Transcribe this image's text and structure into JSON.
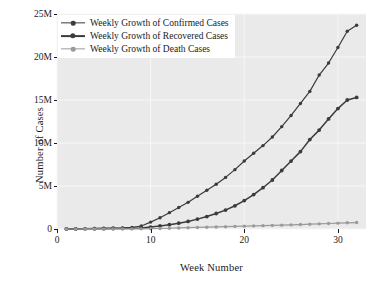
{
  "chart_data": {
    "type": "line",
    "title": "",
    "xlabel": "Week Number",
    "ylabel": "Number of Cases",
    "xlim": [
      0,
      33
    ],
    "ylim": [
      0,
      25000000
    ],
    "xticks": [
      0,
      10,
      20,
      30
    ],
    "xticklabels": [
      "0",
      "10",
      "20",
      "30"
    ],
    "yticks": [
      0,
      5000000,
      10000000,
      15000000,
      20000000,
      25000000
    ],
    "yticklabels": [
      "0",
      "5M",
      "10M",
      "15M",
      "20M",
      "25M"
    ],
    "grid": true,
    "legend_position": "upper left",
    "x": [
      1,
      2,
      3,
      4,
      5,
      6,
      7,
      8,
      9,
      10,
      11,
      12,
      13,
      14,
      15,
      16,
      17,
      18,
      19,
      20,
      21,
      22,
      23,
      24,
      25,
      26,
      27,
      28,
      29,
      30,
      31,
      32
    ],
    "series": [
      {
        "name": "Weekly Growth of Confirmed Cases",
        "color": "#3b3b3b",
        "values": [
          10000,
          25000,
          45000,
          70000,
          95000,
          110000,
          130000,
          180000,
          350000,
          800000,
          1300000,
          1900000,
          2500000,
          3100000,
          3800000,
          4500000,
          5200000,
          6000000,
          6900000,
          7900000,
          8800000,
          9700000,
          10700000,
          11900000,
          13200000,
          14600000,
          16000000,
          17900000,
          19300000,
          21100000,
          23000000,
          23700000
        ]
      },
      {
        "name": "Weekly Growth of Recovered Cases",
        "color": "#3b3b3b",
        "values": [
          5000,
          12000,
          20000,
          30000,
          40000,
          52000,
          63000,
          80000,
          130000,
          220000,
          350000,
          500000,
          680000,
          880000,
          1150000,
          1450000,
          1800000,
          2200000,
          2700000,
          3300000,
          4000000,
          4800000,
          5700000,
          6800000,
          7900000,
          9000000,
          10400000,
          11500000,
          12800000,
          14000000,
          15000000,
          15300000
        ]
      },
      {
        "name": "Weekly Growth of Death Cases",
        "color": "#9a9a9a",
        "values": [
          1000,
          2000,
          3500,
          5000,
          7000,
          9000,
          11000,
          14000,
          20000,
          35000,
          60000,
          90000,
          120000,
          150000,
          180000,
          210000,
          240000,
          270000,
          300000,
          330000,
          360000,
          390000,
          420000,
          450000,
          480000,
          520000,
          560000,
          600000,
          640000,
          680000,
          720000,
          750000
        ]
      }
    ]
  },
  "axes": {
    "xlabel": "Week Number",
    "ylabel": "Number of Cases"
  },
  "legend": {
    "items": [
      {
        "label": "Weekly Growth of Confirmed Cases"
      },
      {
        "label": "Weekly Growth of Recovered Cases"
      },
      {
        "label": "Weekly Growth of Death Cases"
      }
    ]
  },
  "style": {
    "plot_background": "#eaeaea",
    "grid_color": "#f7f7f7",
    "axis_color": "#1a1a1a",
    "figure_background": "#ffffff"
  }
}
